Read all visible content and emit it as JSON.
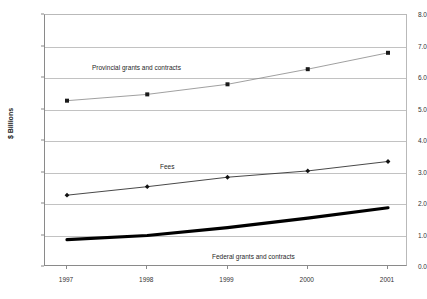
{
  "title_sliver": "",
  "chart_data": {
    "type": "line",
    "title": "",
    "xlabel": "",
    "ylabel": "$ Billions",
    "categories": [
      "1997",
      "1998",
      "1999",
      "2000",
      "2001"
    ],
    "x": [
      1997,
      1998,
      1999,
      2000,
      2001
    ],
    "ylim": [
      0.0,
      8.0
    ],
    "ytick_step": 1.0,
    "ytick_labels": [
      "0.0",
      "1.0",
      "2.0",
      "3.0",
      "4.0",
      "5.0",
      "6.0",
      "7.0",
      "8.0"
    ],
    "ytick_values": [
      0.0,
      1.0,
      2.0,
      3.0,
      4.0,
      5.0,
      6.0,
      7.0,
      8.0
    ],
    "grid": true,
    "legend": "inline-annotations",
    "series": [
      {
        "name": "Provincial grants and contracts",
        "values": [
          5.28,
          5.48,
          5.8,
          6.28,
          6.8
        ],
        "marker": "square",
        "color": "#888888",
        "line_width": 0.8
      },
      {
        "name": "Fees",
        "values": [
          2.28,
          2.55,
          2.85,
          3.05,
          3.35
        ],
        "marker": "diamond",
        "color": "#333333",
        "line_width": 0.9
      },
      {
        "name": "Federal grants and contracts",
        "values": [
          0.87,
          1.0,
          1.25,
          1.55,
          1.88
        ],
        "marker": "none",
        "color": "#000000",
        "line_width": 3.2
      }
    ],
    "annotations": [
      {
        "text": "Provincial grants and contracts",
        "series": "Provincial grants and contracts"
      },
      {
        "text": "Fees",
        "series": "Fees"
      },
      {
        "text": "Federal grants and contracts",
        "series": "Federal grants and contracts"
      }
    ]
  }
}
